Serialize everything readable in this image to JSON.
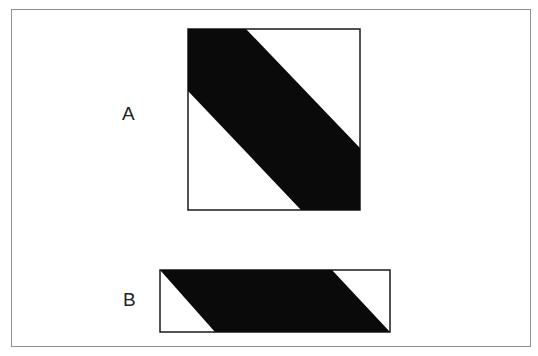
{
  "figure": {
    "labels": {
      "a": "A",
      "b": "B"
    },
    "colors": {
      "fill": "#0a0a0a",
      "outline": "#1a1a1a",
      "background": "#ffffff",
      "frame": "#8f8f8f"
    },
    "shape_a": {
      "type": "square with diagonal band",
      "bounds": {
        "x": 188,
        "y": 29,
        "width": 172,
        "height": 181
      },
      "band_polygon": "188,29 246,29 360,148 360,210 301,210 188,91"
    },
    "shape_b": {
      "type": "rectangle with parallelogram band",
      "bounds": {
        "x": 160,
        "y": 270,
        "width": 230,
        "height": 62
      },
      "band_polygon": "160,270 332,270 390,332 215,332"
    }
  }
}
